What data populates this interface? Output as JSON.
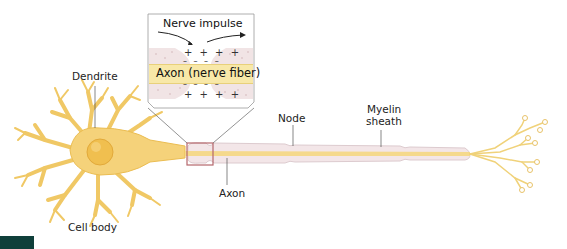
{
  "diagram": {
    "labels": {
      "dendrite": "Dendrite",
      "cell_body": "Cell body",
      "axon": "Axon",
      "node": "Node",
      "myelin_line1": "Myelin",
      "myelin_line2": "sheath"
    },
    "inset": {
      "title": "Nerve impulse",
      "axon_label": "Axon (nerve fiber)",
      "plus_top": "+ + + +",
      "plus_bottom": "+ + + +",
      "minus_top": "– – – –",
      "minus_bottom": "– – – –"
    },
    "colors": {
      "neuron_fill": "#f5d27a",
      "neuron_stroke": "#e8b84a",
      "myelin_fill": "#f3e6e8",
      "myelin_stroke": "#dcc8cc",
      "axon_core": "#f6e2a8",
      "zoom_box": "#b5676c",
      "leader_line": "#555555",
      "corner_block": "#0f3f3a"
    }
  }
}
